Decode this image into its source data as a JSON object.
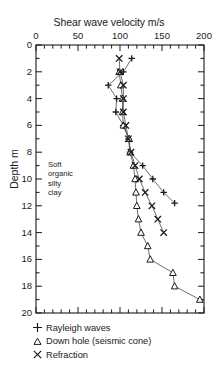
{
  "chart_data": {
    "type": "scatter",
    "title": "Shear wave velocity m/s",
    "xlabel": "Shear wave velocity m/s",
    "ylabel": "Depth m",
    "xlim": [
      0,
      200
    ],
    "ylim": [
      0,
      20
    ],
    "y_inverted": true,
    "grid": false,
    "xticks": [
      0,
      50,
      100,
      150,
      200
    ],
    "xtick_labels": [
      "0",
      "50",
      "100",
      "150",
      "200"
    ],
    "x_minor_tick_step": 10,
    "yticks": [
      0,
      2,
      4,
      6,
      8,
      10,
      12,
      14,
      16,
      18,
      20
    ],
    "ytick_labels": [
      "0",
      "2",
      "4",
      "6",
      "8",
      "10",
      "12",
      "14",
      "16",
      "18",
      "20"
    ],
    "y_minor_tick_step": 1,
    "legend_position": "below-axes",
    "annotations": [
      {
        "text": "Soft organic silty clay",
        "lines": [
          "Soft",
          "organic",
          "silty",
          "clay"
        ],
        "x": 16,
        "y": 9.6
      }
    ],
    "series": [
      {
        "name": "Rayleigh waves",
        "marker": "plus",
        "color": "#1a1a1a",
        "points": [
          {
            "x": 114,
            "y": 1.0
          },
          {
            "x": 104,
            "y": 2.0
          },
          {
            "x": 86,
            "y": 3.0
          },
          {
            "x": 96,
            "y": 4.0
          },
          {
            "x": 95,
            "y": 5.0
          },
          {
            "x": 104,
            "y": 6.0
          },
          {
            "x": 110,
            "y": 7.0
          },
          {
            "x": 112,
            "y": 8.0
          },
          {
            "x": 127,
            "y": 9.0
          },
          {
            "x": 139,
            "y": 10.0
          },
          {
            "x": 152,
            "y": 11.0
          },
          {
            "x": 165,
            "y": 11.8
          }
        ]
      },
      {
        "name": "Down hole (seismic cone)",
        "marker": "triangle",
        "color": "#1a1a1a",
        "points": [
          {
            "x": 99,
            "y": 2.0
          },
          {
            "x": 101,
            "y": 3.0
          },
          {
            "x": 103,
            "y": 4.0
          },
          {
            "x": 103,
            "y": 5.0
          },
          {
            "x": 104,
            "y": 6.0
          },
          {
            "x": 111,
            "y": 7.0
          },
          {
            "x": 112,
            "y": 8.0
          },
          {
            "x": 116,
            "y": 9.0
          },
          {
            "x": 118,
            "y": 10.0
          },
          {
            "x": 119,
            "y": 11.0
          },
          {
            "x": 120,
            "y": 12.0
          },
          {
            "x": 122,
            "y": 13.0
          },
          {
            "x": 125,
            "y": 14.0
          },
          {
            "x": 133,
            "y": 15.0
          },
          {
            "x": 136,
            "y": 16.0
          },
          {
            "x": 163,
            "y": 17.0
          },
          {
            "x": 165,
            "y": 18.0
          },
          {
            "x": 195,
            "y": 19.0
          }
        ]
      },
      {
        "name": "Refraction",
        "marker": "cross",
        "color": "#1a1a1a",
        "points": [
          {
            "x": 99,
            "y": 1.0
          },
          {
            "x": 100,
            "y": 2.0
          },
          {
            "x": 104,
            "y": 3.0
          },
          {
            "x": 104,
            "y": 4.0
          },
          {
            "x": 104,
            "y": 5.0
          },
          {
            "x": 107,
            "y": 6.0
          },
          {
            "x": 110,
            "y": 7.0
          },
          {
            "x": 113,
            "y": 8.0
          },
          {
            "x": 118,
            "y": 9.0
          },
          {
            "x": 123,
            "y": 10.0
          },
          {
            "x": 130,
            "y": 11.0
          },
          {
            "x": 138,
            "y": 12.0
          },
          {
            "x": 145,
            "y": 13.0
          },
          {
            "x": 152,
            "y": 14.0
          }
        ]
      }
    ]
  },
  "legend": {
    "items": [
      {
        "marker": "plus",
        "label": "Rayleigh waves"
      },
      {
        "marker": "triangle",
        "label": "Down hole (seismic cone)"
      },
      {
        "marker": "cross",
        "label": "Refraction"
      }
    ]
  },
  "colors": {
    "axis": "#1a1a1a",
    "marker": "#1a1a1a",
    "line": "#555555",
    "background": "#ffffff"
  }
}
